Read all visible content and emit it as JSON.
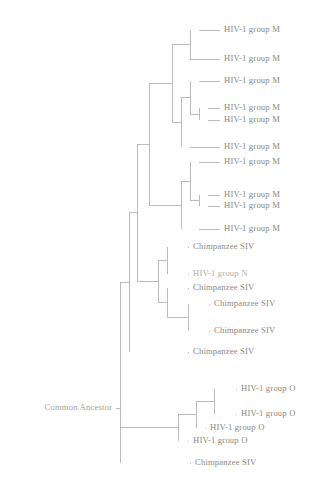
{
  "figure": {
    "type": "phylogenetic-tree",
    "orientation": "left-to-right",
    "background_color": "#ffffff",
    "line_color": "#b9b4b0",
    "text_color": "#8d8781",
    "root": {
      "label": "Common Ancestor",
      "x": 120,
      "y": 408,
      "label_x": 112,
      "label_y": 408
    },
    "leaves": [
      {
        "id": "leaf-1",
        "label": "HIV-1 group M",
        "y": 30,
        "branch_x": 199,
        "label_x": 224,
        "faded": false
      },
      {
        "id": "leaf-2",
        "label": "HIV-1 group M",
        "y": 59,
        "branch_x": 190,
        "label_x": 224,
        "faded": false
      },
      {
        "id": "leaf-3",
        "label": "HIV-1 group M",
        "y": 81,
        "branch_x": 199,
        "label_x": 224,
        "faded": false
      },
      {
        "id": "leaf-4",
        "label": "HIV-1 group M",
        "y": 108,
        "branch_x": 208,
        "label_x": 224,
        "faded": false
      },
      {
        "id": "leaf-5",
        "label": "HIV-1 group M",
        "y": 120,
        "branch_x": 208,
        "label_x": 224,
        "faded": false
      },
      {
        "id": "leaf-6",
        "label": "HIV-1 group M",
        "y": 147,
        "branch_x": 190,
        "label_x": 224,
        "faded": false
      },
      {
        "id": "leaf-7",
        "label": "HIV-1 group M",
        "y": 162,
        "branch_x": 199,
        "label_x": 224,
        "faded": false
      },
      {
        "id": "leaf-8",
        "label": "HIV-1 group M",
        "y": 195,
        "branch_x": 208,
        "label_x": 224,
        "faded": false
      },
      {
        "id": "leaf-9",
        "label": "HIV-1 group M",
        "y": 206,
        "branch_x": 208,
        "label_x": 224,
        "faded": false
      },
      {
        "id": "leaf-10",
        "label": "HIV-1 group M",
        "y": 229,
        "branch_x": 199,
        "label_x": 224,
        "faded": false
      },
      {
        "id": "leaf-11",
        "label": "Chimpanzee SIV",
        "y": 247,
        "branch_x": 188,
        "label_x": 193,
        "faded": false
      },
      {
        "id": "leaf-12",
        "label": "HIV-1 group N",
        "y": 274,
        "branch_x": 188,
        "label_x": 193,
        "faded": true
      },
      {
        "id": "leaf-13",
        "label": "Chimpanzee SIV",
        "y": 288,
        "branch_x": 188,
        "label_x": 193,
        "faded": false
      },
      {
        "id": "leaf-14",
        "label": "Chimpanzee SIV",
        "y": 304,
        "branch_x": 209,
        "label_x": 214,
        "faded": false
      },
      {
        "id": "leaf-15",
        "label": "Chimpanzee SIV",
        "y": 331,
        "branch_x": 209,
        "label_x": 214,
        "faded": false
      },
      {
        "id": "leaf-16",
        "label": "Chimpanzee SIV",
        "y": 352,
        "branch_x": 188,
        "label_x": 193,
        "faded": false
      },
      {
        "id": "leaf-17",
        "label": "HIV-1 group O",
        "y": 389,
        "branch_x": 236,
        "label_x": 241,
        "faded": false
      },
      {
        "id": "leaf-18",
        "label": "HIV-1 group O",
        "y": 414,
        "branch_x": 236,
        "label_x": 241,
        "faded": false
      },
      {
        "id": "leaf-19",
        "label": "HIV-1 group O",
        "y": 428,
        "branch_x": 205,
        "label_x": 210,
        "faded": false
      },
      {
        "id": "leaf-20",
        "label": "HIV-1 group O",
        "y": 441,
        "branch_x": 188,
        "label_x": 193,
        "faded": false
      },
      {
        "id": "leaf-21",
        "label": "Chimpanzee SIV",
        "y": 463,
        "branch_x": 190,
        "label_x": 195,
        "faded": false
      }
    ],
    "internal_nodes": [
      {
        "id": "node-m-a",
        "x": 190,
        "y_top": 30,
        "y_bottom": 59,
        "parent_x": 172
      },
      {
        "id": "node-m-b",
        "x": 199,
        "y_top": 108,
        "y_bottom": 120,
        "parent_x": 190
      },
      {
        "id": "node-m-c",
        "x": 190,
        "y_top": 81,
        "y_bottom": 114,
        "parent_x": 181
      },
      {
        "id": "node-m-d",
        "x": 181,
        "y_top": 97,
        "y_bottom": 147,
        "parent_x": 172
      },
      {
        "id": "node-m-e",
        "x": 172,
        "y_top": 44,
        "y_bottom": 122,
        "parent_x": 149
      },
      {
        "id": "node-m-f",
        "x": 199,
        "y_top": 195,
        "y_bottom": 206,
        "parent_x": 190
      },
      {
        "id": "node-m-g",
        "x": 190,
        "y_top": 162,
        "y_bottom": 200,
        "parent_x": 181
      },
      {
        "id": "node-m-h",
        "x": 181,
        "y_top": 181,
        "y_bottom": 229,
        "parent_x": 149
      },
      {
        "id": "node-m-root",
        "x": 149,
        "y_top": 83,
        "y_bottom": 205,
        "parent_x": 137
      },
      {
        "id": "node-c-a",
        "x": 167,
        "y_top": 247,
        "y_bottom": 274,
        "parent_x": 158
      },
      {
        "id": "node-c-b",
        "x": 188,
        "y_top": 304,
        "y_bottom": 331,
        "parent_x": 167
      },
      {
        "id": "node-c-c",
        "x": 167,
        "y_top": 288,
        "y_bottom": 317,
        "parent_x": 158
      },
      {
        "id": "node-c-d",
        "x": 158,
        "y_top": 260,
        "y_bottom": 302,
        "parent_x": 137
      },
      {
        "id": "node-c-root",
        "x": 137,
        "y_top": 144,
        "y_bottom": 281,
        "parent_x": 129
      },
      {
        "id": "node-mid",
        "x": 129,
        "y_top": 212,
        "y_bottom": 352,
        "parent_x": 120
      },
      {
        "id": "node-o-a",
        "x": 214,
        "y_top": 389,
        "y_bottom": 414,
        "parent_x": 196
      },
      {
        "id": "node-o-b",
        "x": 196,
        "y_top": 401,
        "y_bottom": 428,
        "parent_x": 178
      },
      {
        "id": "node-o-c",
        "x": 178,
        "y_top": 414,
        "y_bottom": 441,
        "parent_x": 120
      },
      {
        "id": "node-root",
        "x": 120,
        "y_top": 282,
        "y_bottom": 463,
        "parent_x": 120
      }
    ]
  }
}
